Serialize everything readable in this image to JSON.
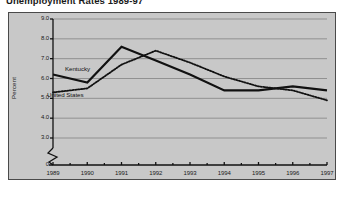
{
  "title": "Unemployment Rates 1989-97",
  "axes": {
    "ylabel": "Percent",
    "yticks": [
      "9.0",
      "8.0",
      "7.0",
      "6.0",
      "5.0",
      "4.0",
      "3.0",
      "0"
    ],
    "xticks": [
      "1989",
      "1990",
      "1991",
      "1992",
      "1993",
      "1994",
      "1995",
      "1996",
      "1997"
    ]
  },
  "series_labels": {
    "kentucky": "Kentucky",
    "united_states": "United States"
  },
  "colors": {
    "panel_background": "#c8c8c8",
    "frame": "#4a4a4a",
    "gridline": "#8a8a8a",
    "series_line": "#111111",
    "text": "#1a1a1a"
  },
  "chart_data": {
    "type": "line",
    "title": "Unemployment Rates 1989-97",
    "xlabel": "",
    "ylabel": "Percent",
    "x": [
      1989,
      1990,
      1991,
      1992,
      1993,
      1994,
      1995,
      1996,
      1997
    ],
    "ylim": [
      3.0,
      9.0
    ],
    "ybreak": true,
    "ybreak_note": "axis broken between 0 and 3.0",
    "grid": true,
    "legend": "inline-labels",
    "series": [
      {
        "name": "Kentucky",
        "style": "solid",
        "values": [
          6.2,
          5.8,
          7.6,
          6.9,
          6.2,
          5.4,
          5.4,
          5.6,
          5.4
        ]
      },
      {
        "name": "United States",
        "style": "dotted",
        "values": [
          5.3,
          5.5,
          6.7,
          7.4,
          6.8,
          6.1,
          5.6,
          5.4,
          4.9
        ]
      }
    ]
  }
}
